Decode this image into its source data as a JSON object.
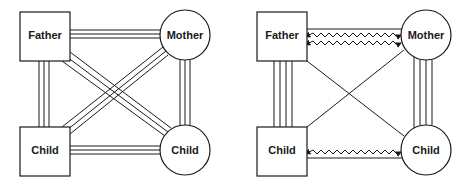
{
  "diagrams": [
    {
      "id": "left",
      "description": "All relationships triple-line (strong bonds)",
      "nodes": {
        "father": {
          "label": "Father",
          "shape": "square"
        },
        "mother": {
          "label": "Mother",
          "shape": "circle"
        },
        "child_square": {
          "label": "Child",
          "shape": "square"
        },
        "child_circle": {
          "label": "Child",
          "shape": "circle"
        }
      },
      "edges": [
        {
          "from": "Father",
          "to": "Mother",
          "style": "triple-line"
        },
        {
          "from": "Father",
          "to": "Child (square)",
          "style": "triple-line"
        },
        {
          "from": "Father",
          "to": "Child (circle)",
          "style": "triple-line"
        },
        {
          "from": "Mother",
          "to": "Child (square)",
          "style": "triple-line"
        },
        {
          "from": "Mother",
          "to": "Child (circle)",
          "style": "triple-line"
        },
        {
          "from": "Child (square)",
          "to": "Child (circle)",
          "style": "triple-line"
        }
      ]
    },
    {
      "id": "right",
      "description": "Mixed relationships: conflict, strong and weak bonds",
      "nodes": {
        "father": {
          "label": "Father",
          "shape": "square"
        },
        "mother": {
          "label": "Mother",
          "shape": "circle"
        },
        "child_square": {
          "label": "Child",
          "shape": "square"
        },
        "child_circle": {
          "label": "Child",
          "shape": "circle"
        }
      },
      "edges": [
        {
          "from": "Father",
          "to": "Mother",
          "style": "single-line-with-two-zigzag-arrows"
        },
        {
          "from": "Father",
          "to": "Child (square)",
          "style": "quadruple-line"
        },
        {
          "from": "Father",
          "to": "Child (circle)",
          "style": "single-line"
        },
        {
          "from": "Mother",
          "to": "Child (square)",
          "style": "single-line"
        },
        {
          "from": "Mother",
          "to": "Child (circle)",
          "style": "quadruple-line"
        },
        {
          "from": "Child (square)",
          "to": "Child (circle)",
          "style": "single-line-with-zigzag-arrow"
        }
      ]
    }
  ]
}
